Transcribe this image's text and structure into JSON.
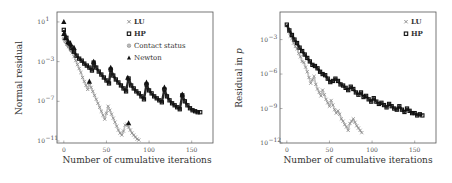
{
  "chart_data": [
    {
      "type": "scatter",
      "title": "",
      "xlabel": "Number of cumulative iterations",
      "ylabel": "Normal residual",
      "yscale": "log",
      "xlim": [
        -8,
        175
      ],
      "ylim_exp": [
        -11.2,
        2
      ],
      "xticks": [
        0,
        50,
        100,
        150
      ],
      "yticks_exp": [
        1,
        -3,
        -7,
        -11
      ],
      "grid": false,
      "legend_position": "upper right",
      "legend": [
        {
          "marker": "x",
          "label": "LU",
          "bold": true
        },
        {
          "marker": "square",
          "label": "HP",
          "bold": true
        },
        {
          "marker": "circle-x",
          "label": "Contact status",
          "bold": false
        },
        {
          "marker": "triangle",
          "label": "Newton",
          "bold": false
        }
      ],
      "series": [
        {
          "name": "LU",
          "color": "#8a8a8a",
          "points_x": [
            0,
            2,
            4,
            6,
            8,
            10,
            12,
            14,
            16,
            18,
            20,
            22,
            24,
            26,
            28,
            30,
            32,
            34,
            36,
            38,
            40,
            42,
            44,
            46,
            48,
            50,
            52,
            54,
            56,
            58,
            60,
            62,
            64,
            66,
            68,
            70,
            72,
            74,
            76,
            78,
            80,
            82,
            84,
            86,
            88
          ],
          "points_exp": [
            -0.3,
            -0.8,
            -1.2,
            -1.5,
            -1.8,
            -2.1,
            -2.5,
            -2.9,
            -3.3,
            -3.7,
            -4.1,
            -4.6,
            -5.0,
            -5.4,
            -5.8,
            -5.2,
            -5.6,
            -6.0,
            -6.4,
            -6.8,
            -7.2,
            -7.6,
            -8.0,
            -8.4,
            -8.8,
            -8.2,
            -7.5,
            -7.9,
            -8.3,
            -8.7,
            -9.1,
            -9.5,
            -9.9,
            -10.2,
            -10.4,
            -10.0,
            -9.4,
            -9.3,
            -9.6,
            -9.9,
            -10.2,
            -10.4,
            -10.6,
            -10.8,
            -10.9
          ]
        },
        {
          "name": "HP",
          "color": "#111111",
          "points_x": [
            0,
            3,
            6,
            9,
            12,
            15,
            18,
            21,
            24,
            27,
            30,
            33,
            35,
            38,
            41,
            44,
            47,
            50,
            53,
            55,
            58,
            61,
            64,
            67,
            70,
            73,
            76,
            79,
            82,
            85,
            88,
            91,
            94,
            97,
            100,
            103,
            106,
            109,
            112,
            115,
            118,
            121,
            124,
            127,
            130,
            133,
            136,
            139,
            142,
            145,
            148,
            151,
            154,
            157,
            160
          ],
          "points_exp": [
            0.2,
            -0.6,
            -1.1,
            -1.6,
            -2.0,
            -2.4,
            -2.7,
            -2.9,
            -3.2,
            -3.4,
            -3.6,
            -3.9,
            -3.1,
            -3.6,
            -4.0,
            -4.3,
            -4.6,
            -4.9,
            -5.2,
            -3.8,
            -4.4,
            -4.8,
            -5.1,
            -5.4,
            -5.7,
            -6.0,
            -4.7,
            -5.4,
            -5.7,
            -6.0,
            -6.2,
            -6.5,
            -6.8,
            -5.3,
            -5.9,
            -6.2,
            -6.5,
            -6.7,
            -6.9,
            -7.1,
            -5.8,
            -6.5,
            -6.9,
            -7.2,
            -7.4,
            -7.6,
            -7.8,
            -6.4,
            -7.0,
            -7.4,
            -7.7,
            -7.9,
            -8.0,
            -8.1,
            -8.1
          ]
        },
        {
          "name": "Contact status",
          "color": "#777777",
          "points_x": [
            0,
            2,
            4,
            6,
            8,
            10
          ],
          "points_exp": [
            -0.7,
            -1.0,
            -1.3,
            -1.5,
            -1.8,
            -2.0
          ]
        },
        {
          "name": "Newton",
          "color": "#111111",
          "points_x": [
            0,
            0,
            2,
            5,
            8,
            12,
            30,
            35,
            55,
            75,
            76,
            97,
            118,
            139
          ],
          "points_exp": [
            1.0,
            -0.2,
            -0.6,
            -1.0,
            -1.2,
            -1.6,
            -5.0,
            -3.0,
            -3.6,
            -4.6,
            -9.2,
            -5.1,
            -5.6,
            -6.3
          ]
        }
      ]
    },
    {
      "type": "scatter",
      "title": "",
      "xlabel": "Number of cumulative iterations",
      "ylabel": "Residual in p",
      "yscale": "log",
      "xlim": [
        -8,
        175
      ],
      "ylim_exp": [
        -12,
        -0.6
      ],
      "xticks": [
        0,
        50,
        100,
        150
      ],
      "yticks_exp": [
        -3,
        -6,
        -9,
        -12
      ],
      "grid": false,
      "legend_position": "upper right",
      "legend": [
        {
          "marker": "x",
          "label": "LU",
          "bold": true
        },
        {
          "marker": "square",
          "label": "HP",
          "bold": true
        }
      ],
      "series": [
        {
          "name": "LU",
          "color": "#8a8a8a",
          "points_x": [
            0,
            2,
            4,
            6,
            8,
            10,
            12,
            14,
            16,
            18,
            20,
            22,
            24,
            26,
            28,
            30,
            32,
            34,
            36,
            38,
            40,
            42,
            44,
            46,
            48,
            50,
            52,
            54,
            56,
            58,
            60,
            62,
            64,
            66,
            68,
            70,
            72,
            74,
            76,
            78,
            80,
            82,
            84,
            86,
            88
          ],
          "points_exp": [
            -1.8,
            -2.3,
            -2.7,
            -2.9,
            -3.3,
            -3.6,
            -3.8,
            -4.2,
            -4.5,
            -4.9,
            -5.0,
            -5.4,
            -5.8,
            -6.3,
            -6.8,
            -6.5,
            -6.2,
            -6.9,
            -7.3,
            -7.6,
            -7.9,
            -7.4,
            -7.8,
            -8.2,
            -8.5,
            -8.8,
            -8.3,
            -8.7,
            -9.1,
            -9.4,
            -9.2,
            -9.5,
            -9.9,
            -10.1,
            -10.4,
            -10.6,
            -10.9,
            -10.3,
            -10.1,
            -9.9,
            -10.2,
            -10.5,
            -10.7,
            -10.9,
            -11.1
          ]
        },
        {
          "name": "HP",
          "color": "#111111",
          "points_x": [
            0,
            3,
            6,
            9,
            12,
            15,
            18,
            21,
            24,
            27,
            30,
            33,
            36,
            39,
            42,
            45,
            48,
            51,
            54,
            57,
            60,
            63,
            66,
            69,
            72,
            75,
            78,
            81,
            84,
            87,
            90,
            93,
            96,
            99,
            102,
            105,
            108,
            111,
            114,
            117,
            120,
            123,
            126,
            129,
            132,
            135,
            138,
            141,
            144,
            147,
            150,
            153,
            156,
            159
          ],
          "points_exp": [
            -1.7,
            -2.2,
            -2.6,
            -3.0,
            -3.3,
            -3.7,
            -4.0,
            -4.3,
            -4.6,
            -4.9,
            -5.2,
            -5.3,
            -5.5,
            -5.8,
            -6.0,
            -6.1,
            -6.4,
            -6.7,
            -6.6,
            -6.4,
            -6.6,
            -6.9,
            -7.0,
            -7.2,
            -7.4,
            -7.1,
            -7.3,
            -7.6,
            -7.8,
            -7.6,
            -8.0,
            -7.9,
            -8.2,
            -8.4,
            -8.1,
            -8.4,
            -8.6,
            -8.5,
            -8.7,
            -8.9,
            -8.6,
            -8.8,
            -9.0,
            -9.1,
            -8.8,
            -9.1,
            -9.3,
            -9.0,
            -9.2,
            -9.4,
            -9.4,
            -9.6,
            -9.5,
            -9.6
          ]
        }
      ]
    }
  ],
  "panels": {
    "left": {
      "xlabel": "Number of cumulative iterations",
      "ylabel": "Normal residual",
      "xtick_labels": [
        "0",
        "50",
        "100",
        "150"
      ],
      "ytick_labels": [
        "10",
        "10",
        "10",
        "10"
      ],
      "ytick_exponents": [
        "1",
        "−3",
        "−7",
        "−11"
      ],
      "legend_labels": [
        "LU",
        "HP",
        "Contact status",
        "Newton"
      ]
    },
    "right": {
      "xlabel": "Number of cumulative iterations",
      "ylabel": "Residual in p",
      "xtick_labels": [
        "0",
        "50",
        "100",
        "150"
      ],
      "ytick_labels": [
        "10",
        "10",
        "10",
        "10"
      ],
      "ytick_exponents": [
        "−3",
        "−6",
        "−9",
        "−12"
      ],
      "legend_labels": [
        "LU",
        "HP"
      ]
    }
  }
}
